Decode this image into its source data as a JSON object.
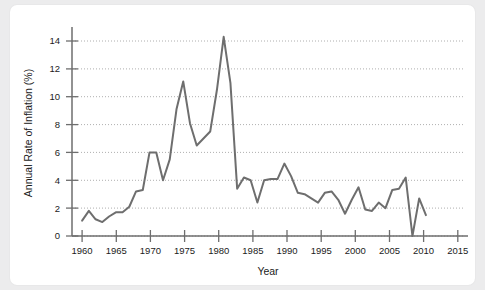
{
  "chart_data": {
    "type": "line",
    "title": "",
    "xlabel": "Year",
    "ylabel": "Annual Rate of Inflation (%)",
    "xlim": [
      1958.5,
      2016.5
    ],
    "ylim": [
      0,
      15
    ],
    "xticks": [
      1960,
      1965,
      1970,
      1975,
      1980,
      1985,
      1990,
      1995,
      2000,
      2005,
      2010,
      2015
    ],
    "xtick_labels": [
      "1960",
      "1965",
      "1970",
      "1975",
      "1980",
      "1985",
      "1990",
      "1995",
      "2000",
      "2005",
      "2010",
      "2015"
    ],
    "yticks": [
      0,
      2,
      4,
      6,
      8,
      10,
      12,
      14
    ],
    "ytick_labels": [
      "0",
      "2",
      "4",
      "6",
      "8",
      "10",
      "12",
      "14"
    ],
    "grid": "horizontal-dotted",
    "legend": "none",
    "line_color": "#6e6e6e",
    "line_width": 2.0,
    "axis_color": "#6e6e6e",
    "grid_color": "#9a9a9a",
    "background": "#ffffff",
    "page_background": "#ececed",
    "x": [
      1960,
      1961,
      1962,
      1963,
      1964,
      1965,
      1966,
      1967,
      1968,
      1969,
      1970,
      1971,
      1972,
      1973,
      1974,
      1975,
      1976,
      1977,
      1978,
      1979,
      1980,
      1981,
      1982,
      1983,
      1984,
      1985,
      1986,
      1987,
      1988,
      1989,
      1990,
      1991,
      1992,
      1993,
      1994,
      1995,
      1996,
      1997,
      1998,
      1999,
      2000,
      2001,
      2002,
      2003,
      2004,
      2005,
      2006,
      2007,
      2008,
      2009,
      2010,
      2011
    ],
    "values": [
      1.1,
      1.8,
      1.2,
      1.0,
      1.4,
      1.7,
      1.7,
      2.1,
      3.2,
      3.3,
      6.0,
      6.0,
      4.0,
      5.5,
      9.1,
      11.1,
      8.1,
      6.5,
      7.0,
      7.5,
      10.5,
      14.3,
      11.0,
      3.4,
      4.2,
      4.0,
      2.4,
      4.0,
      4.1,
      4.1,
      5.2,
      4.3,
      3.1,
      3.0,
      2.7,
      2.4,
      3.1,
      3.2,
      2.6,
      1.6,
      2.6,
      3.5,
      1.9,
      1.8,
      2.4,
      2.0,
      3.3,
      3.4,
      4.2,
      0.0,
      2.7,
      1.5
    ],
    "notable_points": [
      {
        "year": 1975,
        "value": 11.1,
        "note": "local peak"
      },
      {
        "year": 1981,
        "value": 14.3,
        "note": "global maximum"
      },
      {
        "year": 2008,
        "value": 0.0,
        "note": "global minimum"
      }
    ]
  }
}
